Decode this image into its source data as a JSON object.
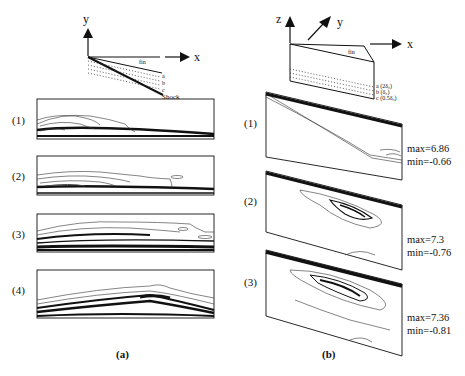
{
  "figure": {
    "panel_a": {
      "label": "(a)",
      "schematic": {
        "axis_x": "x",
        "axis_y": "y",
        "fin_label": "fin",
        "shock_label": "Shock",
        "layer_labels": [
          "a",
          "b",
          "c"
        ]
      },
      "rows": [
        {
          "label": "(1)"
        },
        {
          "label": "(2)"
        },
        {
          "label": "(3)"
        },
        {
          "label": "(4)"
        }
      ]
    },
    "panel_b": {
      "label": "(b)",
      "schematic": {
        "axis_x": "x",
        "axis_y": "y",
        "axis_z": "z",
        "fin_label": "fin",
        "layer_labels": [
          "a (2δ₀)",
          "b (δ₀)",
          "c (0.5δ₀)"
        ]
      },
      "rows": [
        {
          "label": "(1)",
          "max": "max=6.86",
          "min": "min=-0.66"
        },
        {
          "label": "(2)",
          "max": "max=7.3",
          "min": "min=-0.76"
        },
        {
          "label": "(3)",
          "max": "max=7.36",
          "min": "min=-0.81"
        }
      ]
    },
    "colors": {
      "ink": "#111111",
      "background": "#ffffff"
    }
  }
}
